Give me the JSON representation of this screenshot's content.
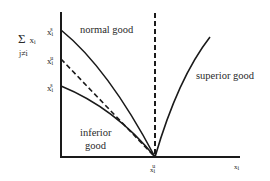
{
  "diagram": {
    "y_axis": {
      "label_sum": "Σ",
      "label_var": "x",
      "label_var_sub": "i",
      "label_index": "j≠i"
    },
    "x_axis": {
      "label": "x",
      "label_sub": "i"
    },
    "y_ticks": [
      {
        "base": "x",
        "sub": "i",
        "sup": "s",
        "y": 30
      },
      {
        "base": "x",
        "sub": "i",
        "sup": "u",
        "y": 59
      },
      {
        "base": "x",
        "sub": "i",
        "sup": "s",
        "y": 86
      }
    ],
    "x_ticks": [
      {
        "base": "x",
        "sub": "i",
        "sup": "u",
        "x": 155
      }
    ],
    "curves": [
      {
        "name": "normal good",
        "style": "solid"
      },
      {
        "name": "",
        "style": "dashed"
      },
      {
        "name": "inferior",
        "name_line2": "good",
        "style": "solid"
      },
      {
        "name": "superior good",
        "style": "solid"
      },
      {
        "name": "",
        "style": "dashed-vertical"
      }
    ],
    "colors": {
      "line": "#1a1a1a",
      "background": "#ffffff"
    }
  }
}
